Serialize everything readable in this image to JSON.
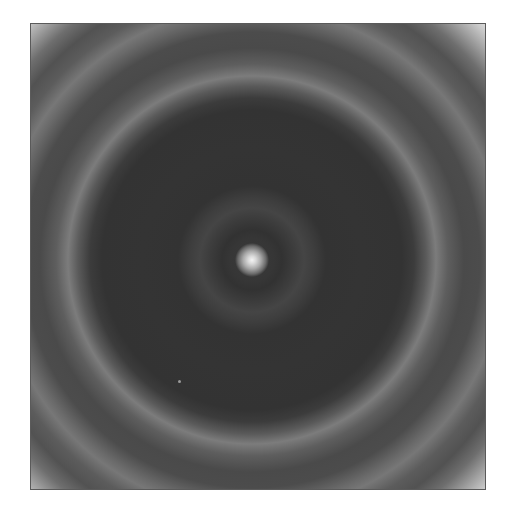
{
  "image": {
    "description": "Grayscale concentric ring (diffraction-like) pattern with bright central spot inside a square frame",
    "frame": {
      "left": 30,
      "top": 23,
      "right": 486,
      "bottom": 490
    },
    "center": {
      "x": 251,
      "y": 259
    },
    "central_spot_radius_px": 15,
    "rings": [
      {
        "type": "faint-inner",
        "radius_px": 52
      },
      {
        "type": "bright",
        "radius_px": 184
      },
      {
        "type": "faint-outer",
        "radius_px": 252
      },
      {
        "type": "bright-corners",
        "radius_px": 330
      }
    ],
    "speck": {
      "x": 178,
      "y": 380
    },
    "colors": {
      "background": "#ffffff",
      "core": "#333333",
      "bright_ring": "#7c7c7c",
      "center": "#f4f4f4",
      "corners": "#eeeeee"
    }
  }
}
